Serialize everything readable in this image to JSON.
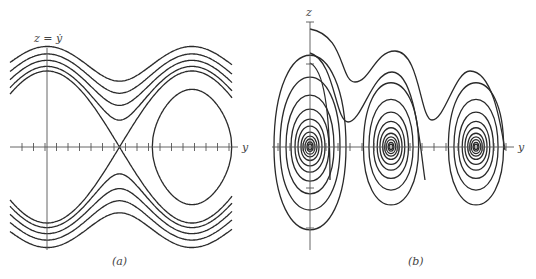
{
  "figure": {
    "panels": [
      {
        "id": "a",
        "caption": "(a)",
        "vertical_axis_label": "z = ẏ",
        "horizontal_axis_label": "y",
        "description": "Phase portrait of undamped pendulum: closed orbits around centers, separatrices through saddles, and rotating (running) trajectories above and below",
        "centers_count": 3,
        "saddles_count": 2
      },
      {
        "id": "b",
        "caption": "(b)",
        "vertical_axis_label": "z",
        "horizontal_axis_label": "y",
        "description": "Phase portrait of damped pendulum: trajectories spiral into stable foci, with running trajectories decaying from top",
        "foci_count": 3
      }
    ]
  }
}
